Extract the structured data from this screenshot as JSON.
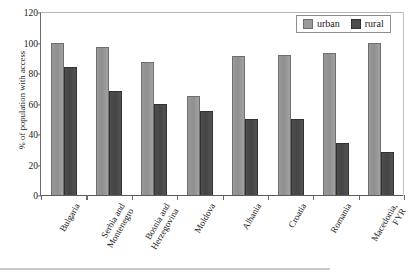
{
  "chart_data": {
    "type": "bar",
    "title": "",
    "xlabel": "",
    "ylabel": "% of population with access",
    "ylim": [
      0,
      120
    ],
    "yticks": [
      0,
      20,
      40,
      60,
      80,
      100,
      120
    ],
    "grid": false,
    "legend_position": "top-right",
    "categories": [
      "Bulgaria",
      "Serbia and Montenegro",
      "Bosnia and Herzegovina",
      "Moldova",
      "Albania",
      "Croatia",
      "Romania",
      "Macedonia, FYR"
    ],
    "category_lines": [
      [
        "Bulgaria"
      ],
      [
        "Serbia and",
        "Montenegro"
      ],
      [
        "Bosnia and",
        "Herzegovina"
      ],
      [
        "Moldova"
      ],
      [
        "Albania"
      ],
      [
        "Croatia"
      ],
      [
        "Romania"
      ],
      [
        "Macedonia,",
        "FYR"
      ]
    ],
    "series": [
      {
        "name": "urban",
        "color": "#9a9a9a",
        "values": [
          100,
          97,
          87,
          65,
          91,
          92,
          93,
          100
        ]
      },
      {
        "name": "rural",
        "color": "#4a4a4a",
        "values": [
          84,
          68,
          60,
          55,
          50,
          50,
          34,
          28
        ]
      }
    ]
  },
  "legend": {
    "items": [
      {
        "label": "urban"
      },
      {
        "label": "rural"
      }
    ]
  }
}
